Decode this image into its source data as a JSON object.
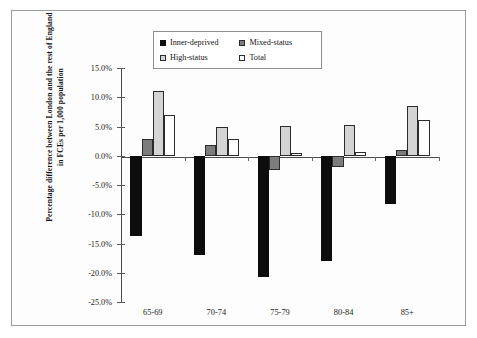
{
  "chart_data": {
    "type": "bar",
    "title": "",
    "xlabel": "",
    "ylabel": "Percentage difference between London and the rest of England in FCEs per 1,000 population",
    "categories": [
      "65-69",
      "70-74",
      "75-79",
      "80-84",
      "85+"
    ],
    "ylim": [
      -25.0,
      15.0
    ],
    "ytick_labels": [
      "15.0%",
      "10.0%",
      "5.0%",
      "0.0%",
      "-5.0%",
      "-10.0%",
      "-15.0%",
      "-20.0%",
      "-25.0%"
    ],
    "ytick_values": [
      15.0,
      10.0,
      5.0,
      0.0,
      -5.0,
      -10.0,
      -15.0,
      -20.0,
      -25.0
    ],
    "grid": false,
    "legend_position": "top-center",
    "value_suffix": "%",
    "series": [
      {
        "name": "Inner-deprived",
        "color": "#0d0d0d",
        "values": [
          -13.7,
          -17.0,
          -20.7,
          -18.0,
          -8.2
        ]
      },
      {
        "name": "Mixed-status",
        "color": "#7c7c7c",
        "values": [
          2.8,
          1.8,
          -2.4,
          -2.0,
          1.0
        ]
      },
      {
        "name": "High-status",
        "color": "#d4d4d4",
        "values": [
          11.1,
          4.9,
          5.1,
          5.3,
          8.5
        ]
      },
      {
        "name": "Total",
        "color": "#ffffff",
        "values": [
          7.0,
          2.9,
          0.5,
          0.6,
          6.1
        ]
      }
    ]
  }
}
